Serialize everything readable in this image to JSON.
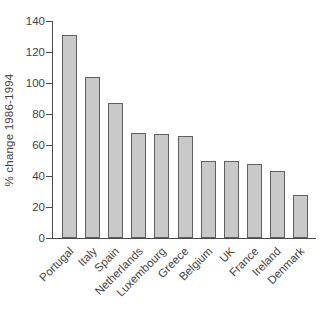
{
  "chart_data": {
    "type": "bar",
    "ylabel": "% change 1986-1994",
    "xlabel": "",
    "categories": [
      "Portugal",
      "Italy",
      "Spain",
      "Netherlands",
      "Luxembourg",
      "Greece",
      "Belgium",
      "UK",
      "France",
      "Ireland",
      "Denmark"
    ],
    "values": [
      131,
      104,
      87,
      68,
      67,
      66,
      50,
      50,
      48,
      43,
      28
    ],
    "ylim": [
      0,
      140
    ],
    "yticks": [
      0,
      20,
      40,
      60,
      80,
      100,
      120,
      140
    ],
    "grid": false,
    "legend": "none",
    "x_label_rotation_deg": 45,
    "bar_fill": "#c9c9c9",
    "bar_border": "#606060",
    "axis_color": "#4a4a4a",
    "text_color": "#3f3f3f",
    "background": "#ffffff"
  }
}
